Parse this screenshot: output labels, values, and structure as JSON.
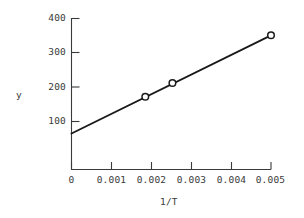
{
  "chart_data": {
    "type": "line",
    "title": "",
    "subtitle": "",
    "xlabel": "1/T",
    "ylabel": "y",
    "xlim": [
      0,
      0.0055
    ],
    "ylim": [
      0,
      400
    ],
    "grid": false,
    "legend": null,
    "marker": "open-circle",
    "line_color": "#1a1a1a",
    "marker_edge_color": "#1a1a1a",
    "marker_face_color": "#ffffff",
    "axis_color": "#3a3a3a",
    "background_color": "#ffffff",
    "xticks": [
      0,
      0.001,
      0.002,
      0.003,
      0.004,
      0.005
    ],
    "xtick_labels": [
      "0",
      "0.001",
      "0.002",
      "0.003",
      "0.004",
      "0.005"
    ],
    "yticks": [
      100,
      200,
      300,
      400
    ],
    "ytick_labels": [
      "100",
      "200",
      "300",
      "400"
    ],
    "x": [
      0.00185,
      0.00253,
      0.005
    ],
    "values": [
      172,
      212,
      351
    ],
    "series": [
      {
        "name": "y vs 1/T",
        "x": [
          0.00185,
          0.00253,
          0.005
        ],
        "values": [
          172,
          212,
          351
        ]
      }
    ],
    "fit_line": {
      "intercept": 65,
      "slope": 57200,
      "x_start": 0.0,
      "y_start": 65,
      "x_end": 0.00505,
      "y_end": 354
    },
    "annotations": []
  }
}
